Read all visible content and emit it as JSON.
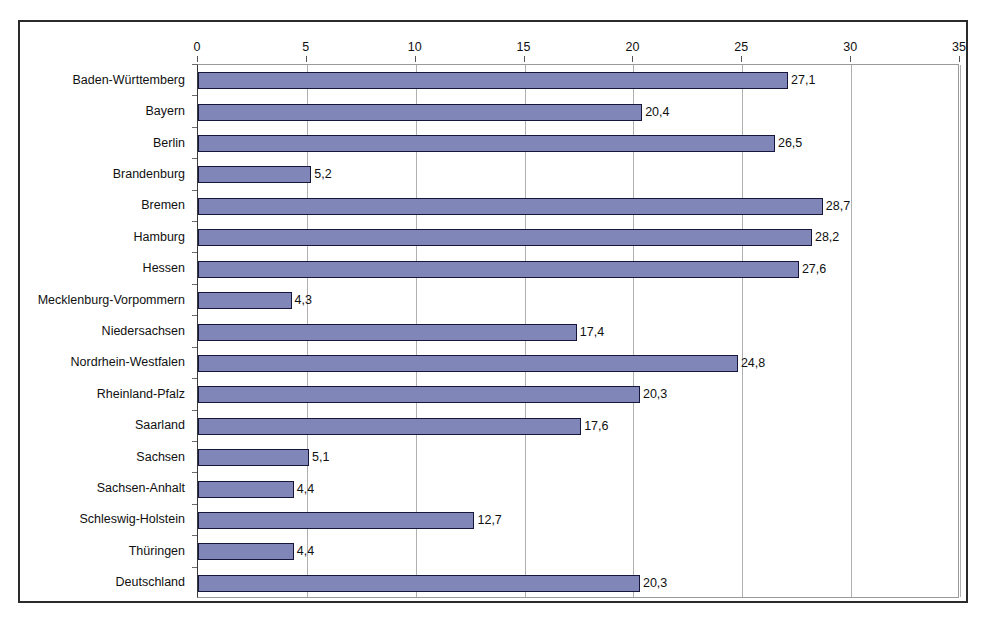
{
  "chart_data": {
    "type": "bar",
    "orientation": "horizontal",
    "title": "",
    "subtitle": "",
    "xlabel": "",
    "ylabel": "",
    "xlim": [
      0,
      35
    ],
    "xticks": [
      0,
      5,
      10,
      15,
      20,
      25,
      30,
      35
    ],
    "xtick_labels": [
      "0",
      "5",
      "10",
      "15",
      "20",
      "25",
      "30",
      "35"
    ],
    "grid": true,
    "grid_axis": "x",
    "legend": false,
    "decimal_separator": ",",
    "bar_color": "#8186b8",
    "bar_border_color": "#16163a",
    "categories": [
      "Baden-Württemberg",
      "Bayern",
      "Berlin",
      "Brandenburg",
      "Bremen",
      "Hamburg",
      "Hessen",
      "Mecklenburg-Vorpommern",
      "Niedersachsen",
      "Nordrhein-Westfalen",
      "Rheinland-Pfalz",
      "Saarland",
      "Sachsen",
      "Sachsen-Anhalt",
      "Schleswig-Holstein",
      "Thüringen",
      "Deutschland"
    ],
    "values": [
      27.1,
      20.4,
      26.5,
      5.2,
      28.7,
      28.2,
      27.6,
      4.3,
      17.4,
      24.8,
      20.3,
      17.6,
      5.1,
      4.4,
      12.7,
      4.4,
      20.3
    ],
    "value_labels": [
      "27,1",
      "20,4",
      "26,5",
      "5,2",
      "28,7",
      "28,2",
      "27,6",
      "4,3",
      "17,4",
      "24,8",
      "20,3",
      "17,6",
      "5,1",
      "4,4",
      "12,7",
      "4,4",
      "20,3"
    ]
  }
}
